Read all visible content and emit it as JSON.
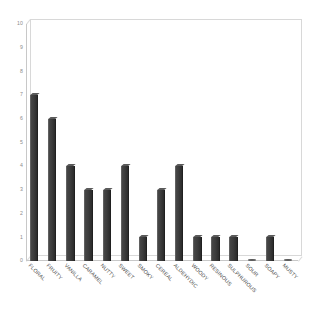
{
  "chart_data": {
    "type": "bar",
    "title": "",
    "subtitle": "",
    "xlabel": "",
    "ylabel": "",
    "ylim": [
      0,
      10
    ],
    "grid": false,
    "legend": null,
    "legend_position": "none",
    "style": "3d-column",
    "bar_color": "#3c3c3c",
    "bar_edge_color": "#202020",
    "frame_color": "#d0d0d0",
    "tick_label_color": "#8c8c8c",
    "category_label_color": "#4a4a4a",
    "background_color": "#ffffff",
    "category_label_rotation": 45,
    "yticks": [
      0,
      1,
      2,
      3,
      4,
      5,
      6,
      7,
      8,
      9,
      10
    ],
    "ytick_labels": [
      "0",
      "1",
      "2",
      "3",
      "4",
      "5",
      "6",
      "7",
      "8",
      "9",
      "10"
    ],
    "categories": [
      "FLORAL",
      "FRUITY",
      "VANILLA",
      "CARAMEL",
      "NUTTY",
      "SWEET",
      "SMOKY",
      "CEREAL",
      "ALDEHYDIC",
      "WOODY",
      "RESINOUS",
      "SULPHUROUS",
      "SOUR",
      "SOAPY",
      "MUSTY"
    ],
    "values": [
      7,
      6,
      4,
      3,
      3,
      4,
      1,
      3,
      4,
      1,
      1,
      1,
      0,
      1,
      0
    ]
  }
}
